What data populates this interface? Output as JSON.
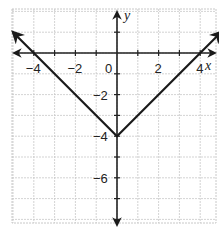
{
  "chart_data": {
    "type": "line",
    "title": "",
    "xlabel": "x",
    "ylabel": "y",
    "xlim": [
      -5,
      5
    ],
    "ylim": [
      -8,
      2
    ],
    "grid": true,
    "x_tick_labels": [
      {
        "value": -4,
        "label": "−4"
      },
      {
        "value": -2,
        "label": "−2"
      },
      {
        "value": 0,
        "label": "0"
      },
      {
        "value": 2,
        "label": "2"
      },
      {
        "value": 4,
        "label": "4"
      }
    ],
    "y_tick_labels": [
      {
        "value": -2,
        "label": "−2"
      },
      {
        "value": -4,
        "label": "−4"
      },
      {
        "value": -6,
        "label": "−6"
      }
    ],
    "series": [
      {
        "name": "y = |x| - 4",
        "x": [
          -5,
          -4,
          0,
          4,
          5
        ],
        "y": [
          1,
          0,
          -4,
          0,
          1
        ],
        "arrows_both_ends": true
      }
    ],
    "vertex": {
      "x": 0,
      "y": -4
    },
    "x_intercepts": [
      -4,
      4
    ],
    "colors": {
      "grid": "#c8c8c8",
      "axis": "#222222",
      "curve": "#1a1a1a"
    }
  }
}
